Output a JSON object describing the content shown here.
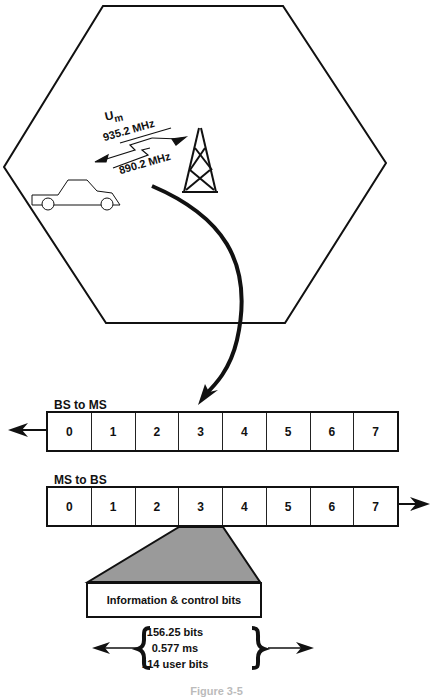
{
  "cell": {
    "interface_label": "U",
    "interface_subscript": "m",
    "downlink_freq": "935.2 MHz",
    "uplink_freq": "890.2 MHz",
    "mobile_icon": "car-icon",
    "base_station_icon": "tower-icon"
  },
  "frames": {
    "downlink": {
      "label": "BS to MS",
      "direction": "left",
      "slots": [
        "0",
        "1",
        "2",
        "3",
        "4",
        "5",
        "6",
        "7"
      ]
    },
    "uplink": {
      "label": "MS to BS",
      "direction": "right",
      "slots": [
        "0",
        "1",
        "2",
        "3",
        "4",
        "5",
        "6",
        "7"
      ]
    }
  },
  "burst": {
    "expanded_slot": "3",
    "content_label": "Information & control bits",
    "fill_color": "#9a9a9a",
    "stats": [
      "156.25 bits",
      "0.577 ms",
      "114 user bits"
    ]
  },
  "caption": "Figure 3-5"
}
